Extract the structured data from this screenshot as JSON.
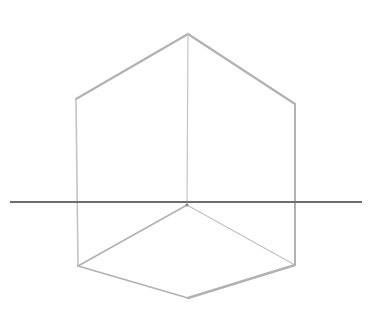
{
  "drawing": {
    "subject": "cube wireframe sketch with horizon line",
    "colors": {
      "background": "#ffffff",
      "pencil_light": "#c8c8c8",
      "pencil_mid": "#b4b4b4",
      "horizon": "#6e6e6e"
    },
    "vertices": {
      "top": [
        188,
        34
      ],
      "top_left": [
        76,
        99
      ],
      "top_right": [
        295,
        104
      ],
      "center": [
        187,
        205
      ],
      "bottom_left": [
        78,
        266
      ],
      "bottom_right": [
        295,
        265
      ],
      "bottom": [
        188,
        298
      ]
    },
    "horizon_line": {
      "x1": 10,
      "y1": 202,
      "x2": 362,
      "y2": 202
    }
  }
}
